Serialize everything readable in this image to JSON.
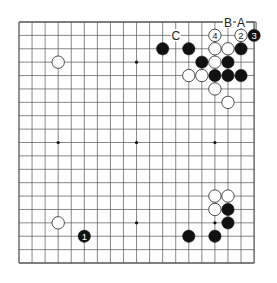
{
  "diagram": {
    "type": "go-board",
    "size": 19,
    "geometry": {
      "left": 19,
      "top": 22,
      "dx": 13.06,
      "dy": 13.39,
      "stone_r": 6.2
    },
    "colors": {
      "line": "#555555",
      "black": "#111111",
      "white": "#ffffff",
      "label": "#222222"
    },
    "star_points": [
      [
        3,
        3
      ],
      [
        9,
        3
      ],
      [
        15,
        3
      ],
      [
        3,
        9
      ],
      [
        9,
        9
      ],
      [
        15,
        9
      ],
      [
        3,
        15
      ],
      [
        9,
        15
      ],
      [
        15,
        15
      ]
    ],
    "stones": [
      {
        "color": "white",
        "col": 3,
        "row": 3
      },
      {
        "color": "black",
        "col": 11,
        "row": 2
      },
      {
        "color": "black",
        "col": 13,
        "row": 2
      },
      {
        "color": "white",
        "col": 15,
        "row": 1,
        "label": "4"
      },
      {
        "color": "white",
        "col": 17,
        "row": 1,
        "label": "2"
      },
      {
        "color": "black",
        "col": 18,
        "row": 1,
        "label": "3"
      },
      {
        "color": "white",
        "col": 15,
        "row": 2
      },
      {
        "color": "white",
        "col": 16,
        "row": 2
      },
      {
        "color": "black",
        "col": 17,
        "row": 2
      },
      {
        "color": "black",
        "col": 14,
        "row": 3
      },
      {
        "color": "white",
        "col": 15,
        "row": 3
      },
      {
        "color": "black",
        "col": 16,
        "row": 3
      },
      {
        "color": "white",
        "col": 13,
        "row": 4
      },
      {
        "color": "white",
        "col": 14,
        "row": 4
      },
      {
        "color": "black",
        "col": 15,
        "row": 4
      },
      {
        "color": "black",
        "col": 16,
        "row": 4
      },
      {
        "color": "black",
        "col": 17,
        "row": 4
      },
      {
        "color": "white",
        "col": 15,
        "row": 5
      },
      {
        "color": "white",
        "col": 16,
        "row": 6
      },
      {
        "color": "white",
        "col": 15,
        "row": 13
      },
      {
        "color": "white",
        "col": 16,
        "row": 13
      },
      {
        "color": "white",
        "col": 15,
        "row": 14
      },
      {
        "color": "black",
        "col": 16,
        "row": 14
      },
      {
        "color": "black",
        "col": 16,
        "row": 15
      },
      {
        "color": "black",
        "col": 13,
        "row": 16
      },
      {
        "color": "black",
        "col": 15,
        "row": 16
      },
      {
        "color": "white",
        "col": 3,
        "row": 15
      },
      {
        "color": "black",
        "col": 5,
        "row": 16,
        "label": "1"
      }
    ],
    "letters": [
      {
        "text": "C",
        "col": 12,
        "row": 1
      },
      {
        "text": "B",
        "col": 16,
        "row": 0
      },
      {
        "text": "A",
        "col": 17,
        "row": 0
      }
    ]
  }
}
